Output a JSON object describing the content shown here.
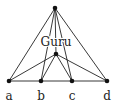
{
  "diagram": {
    "center_label": "Guru",
    "nodes": [
      {
        "id": "top",
        "x": 55,
        "y": 8,
        "label": ""
      },
      {
        "id": "mid",
        "x": 56,
        "y": 54,
        "label": ""
      },
      {
        "id": "a",
        "x": 9,
        "y": 81,
        "label": "a"
      },
      {
        "id": "b",
        "x": 41,
        "y": 81,
        "label": "b"
      },
      {
        "id": "c",
        "x": 72,
        "y": 81,
        "label": "c"
      },
      {
        "id": "d",
        "x": 107,
        "y": 81,
        "label": "d"
      }
    ],
    "edges": [
      [
        "top",
        "a"
      ],
      [
        "top",
        "b"
      ],
      [
        "top",
        "c"
      ],
      [
        "top",
        "d"
      ],
      [
        "top",
        "mid"
      ],
      [
        "mid",
        "a"
      ],
      [
        "mid",
        "b"
      ],
      [
        "mid",
        "c"
      ],
      [
        "mid",
        "d"
      ],
      [
        "a",
        "d"
      ]
    ],
    "colors": {
      "line": "#222222",
      "node": "#111111"
    }
  }
}
